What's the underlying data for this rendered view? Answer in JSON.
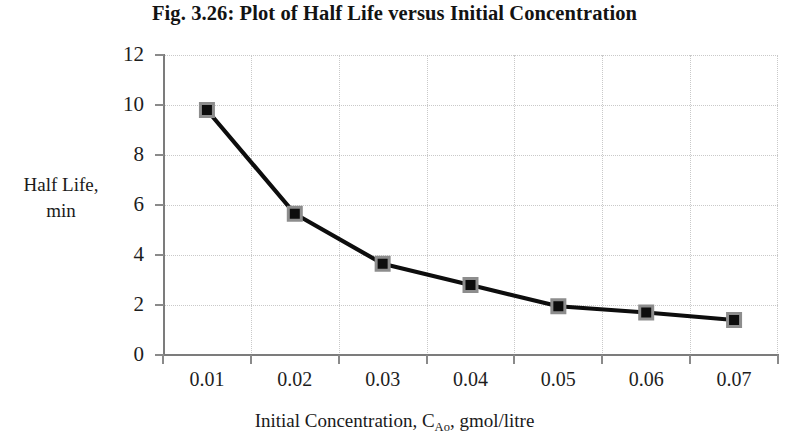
{
  "figure": {
    "title": "Fig. 3.26:  Plot of Half Life versus Initial Concentration"
  },
  "axes": {
    "y_title_line1": "Half Life,",
    "y_title_line2": "min",
    "x_title_prefix": "Initial Concentration, C",
    "x_title_subscript": "Ao",
    "x_title_suffix": ", gmol/litre",
    "y_ticks": [
      "0",
      "2",
      "4",
      "6",
      "8",
      "10",
      "12"
    ],
    "x_ticks": [
      "0.01",
      "0.02",
      "0.03",
      "0.04",
      "0.05",
      "0.06",
      "0.07"
    ]
  },
  "colors": {
    "line": "#0d0d0d",
    "marker_fill": "#0d0d0d",
    "marker_border": "#8d8d8d",
    "gridline": "#c9c9c9",
    "axis": "#7c7c7c",
    "text": "#1a1a1a",
    "background": "#ffffff"
  },
  "chart_data": {
    "type": "line",
    "title": "Fig. 3.26:  Plot of Half Life versus Initial Concentration",
    "xlabel": "Initial Concentration, C_Ao, gmol/litre",
    "ylabel": "Half Life, min",
    "categories": [
      "0.01",
      "0.02",
      "0.03",
      "0.04",
      "0.05",
      "0.06",
      "0.07"
    ],
    "x": [
      0.01,
      0.02,
      0.03,
      0.04,
      0.05,
      0.06,
      0.07
    ],
    "values": [
      9.8,
      5.65,
      3.65,
      2.8,
      1.95,
      1.7,
      1.4
    ],
    "series": [
      {
        "name": "Half Life",
        "values": [
          9.8,
          5.65,
          3.65,
          2.8,
          1.95,
          1.7,
          1.4
        ]
      }
    ],
    "ylim": [
      0,
      12
    ],
    "ytick_step": 2,
    "grid": true,
    "grid_style": "dotted",
    "legend": false,
    "marker": "square"
  }
}
